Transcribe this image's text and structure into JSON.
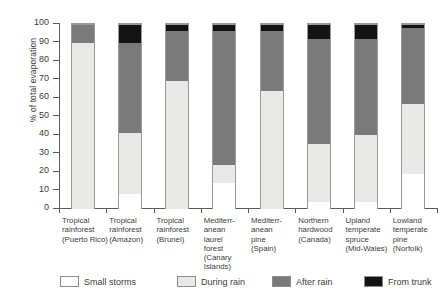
{
  "chart_data": {
    "type": "bar",
    "stacked": true,
    "title": "",
    "xlabel": "",
    "ylabel": "% of total evaporation",
    "ylim": [
      0,
      100
    ],
    "yticks": [
      0,
      10,
      20,
      30,
      40,
      50,
      60,
      70,
      80,
      90,
      100
    ],
    "grid": false,
    "legend_position": "bottom",
    "categories": [
      "Tropical rainforest (Puerto Rico)",
      "Tropical rainforest (Amazon)",
      "Tropical rainforest (Brunei)",
      "Mediterranean laurel forest (Canary Islands)",
      "Mediterranean pine (Spain)",
      "Northern hardwood (Canada)",
      "Upland temperate spruce (Mid-Wales)",
      "Lowland temperate pine (Norfolk)"
    ],
    "category_lines": [
      [
        "Tropical",
        "rainforest",
        "(Puerto Rico)"
      ],
      [
        "Tropical",
        "rainforest",
        "(Amazon)"
      ],
      [
        "Tropical",
        "rainforest",
        "(Brunei)"
      ],
      [
        "Mediterr-",
        "anean",
        "laurel",
        "forest",
        "(Canary",
        "Islands)"
      ],
      [
        "Mediterr-",
        "anean",
        "pine",
        "(Spain)"
      ],
      [
        "Northern",
        "hardwood",
        "(Canada)"
      ],
      [
        "Upland",
        "temperate",
        "spruce",
        "(Mid-Wales)"
      ],
      [
        "Lowland",
        "temperate",
        "pine",
        "(Norfolk)"
      ]
    ],
    "series": [
      {
        "name": "Small storms",
        "color": "#ffffff",
        "values": [
          0,
          8,
          0,
          14,
          0,
          4,
          4,
          19
        ]
      },
      {
        "name": "During rain",
        "color": "#e8e8e6",
        "values": [
          90,
          33,
          69,
          10,
          64,
          31,
          36,
          38
        ]
      },
      {
        "name": "After rain",
        "color": "#7a7a7a",
        "values": [
          10,
          49,
          27,
          72,
          32,
          57,
          52,
          41
        ]
      },
      {
        "name": "From trunk",
        "color": "#131313",
        "values": [
          0,
          10,
          4,
          4,
          4,
          8,
          8,
          2
        ]
      }
    ],
    "cumulative_tops": [
      [
        0,
        90,
        100,
        100
      ],
      [
        8,
        41,
        90,
        100
      ],
      [
        0,
        69,
        96,
        100
      ],
      [
        14,
        24,
        96,
        100
      ],
      [
        0,
        64,
        96,
        100
      ],
      [
        4,
        35,
        92,
        100
      ],
      [
        4,
        40,
        92,
        100
      ],
      [
        19,
        57,
        98,
        100
      ]
    ]
  },
  "legend": {
    "items": [
      {
        "label": "Small storms",
        "color": "#ffffff"
      },
      {
        "label": "During rain",
        "color": "#e8e8e6"
      },
      {
        "label": "After rain",
        "color": "#7a7a7a"
      },
      {
        "label": "From trunk",
        "color": "#131313"
      }
    ]
  }
}
